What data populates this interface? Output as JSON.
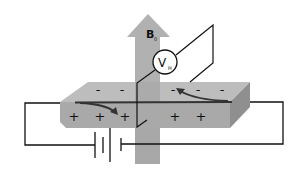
{
  "diagram": {
    "field_label": "B",
    "field_subscript": "0",
    "voltmeter_label": "V",
    "voltmeter_subscript": "H",
    "top_charges": [
      "-",
      "-",
      "-",
      "-",
      "-"
    ],
    "bottom_charges": [
      "+",
      "+",
      "+",
      "+",
      "+"
    ],
    "colors": {
      "arrow": "#a8a8a8",
      "slab_top": "#b8b8b8",
      "slab_front": "#aaaaaa",
      "slab_side": "#8e8e8e",
      "wire": "#111111",
      "current_arrow": "#333333"
    }
  }
}
